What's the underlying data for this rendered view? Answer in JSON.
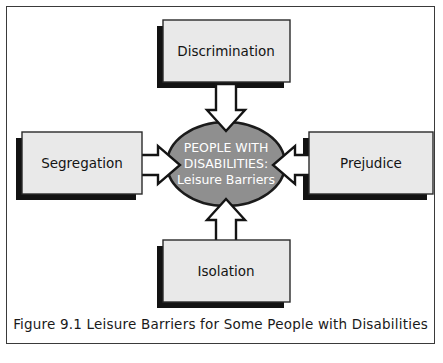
{
  "figure": {
    "caption": "Figure 9.1  Leisure Barriers for Some People with Disabilities",
    "frame_color": "#3a3a3a",
    "background": "#ffffff"
  },
  "center_node": {
    "name": "people-with-disabilities-leisure-barriers",
    "line1": "PEOPLE WITH",
    "line2": "DISABILITIES:",
    "line3": "Leisure Barriers",
    "shape": "ellipse",
    "fill": "#8f8f8f",
    "stroke": "#1b1b1b",
    "text_color": "#ffffff"
  },
  "barrier_nodes": [
    {
      "id": "discrimination",
      "label": "Discrimination",
      "position": "top",
      "fill": "#e9e9e9",
      "stroke": "#2a2a2a",
      "shadow": "#121212"
    },
    {
      "id": "segregation",
      "label": "Segregation",
      "position": "left",
      "fill": "#e9e9e9",
      "stroke": "#2a2a2a",
      "shadow": "#121212"
    },
    {
      "id": "prejudice",
      "label": "Prejudice",
      "position": "right",
      "fill": "#e9e9e9",
      "stroke": "#2a2a2a",
      "shadow": "#121212"
    },
    {
      "id": "isolation",
      "label": "Isolation",
      "position": "bottom",
      "fill": "#e9e9e9",
      "stroke": "#2a2a2a",
      "shadow": "#121212"
    }
  ],
  "arrows": [
    {
      "id": "arrow-discrimination-to-center",
      "from": "discrimination",
      "to": "center",
      "direction": "down",
      "fill": "#ffffff",
      "stroke": "#141414"
    },
    {
      "id": "arrow-segregation-to-center",
      "from": "segregation",
      "to": "center",
      "direction": "right",
      "fill": "#ffffff",
      "stroke": "#141414"
    },
    {
      "id": "arrow-prejudice-to-center",
      "from": "prejudice",
      "to": "center",
      "direction": "left",
      "fill": "#ffffff",
      "stroke": "#141414"
    },
    {
      "id": "arrow-isolation-to-center",
      "from": "isolation",
      "to": "center",
      "direction": "up",
      "fill": "#ffffff",
      "stroke": "#141414"
    }
  ]
}
